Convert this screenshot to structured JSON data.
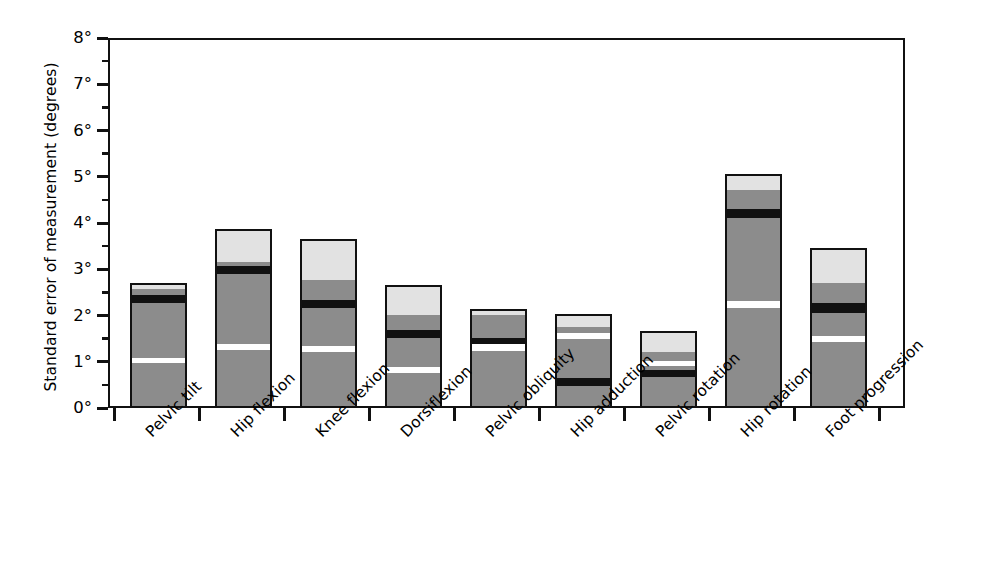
{
  "chart_data": {
    "type": "bar",
    "title": "",
    "subtitle": "",
    "xlabel": "",
    "ylabel": "Standard error of measurement (degrees)",
    "ylim": [
      0,
      8
    ],
    "ytick_values": [
      0,
      1,
      2,
      3,
      4,
      5,
      6,
      7,
      8
    ],
    "ytick_labels": [
      "0°",
      "1°",
      "2°",
      "3°",
      "4°",
      "5°",
      "6°",
      "7°",
      "8°"
    ],
    "ytick_minor_step": 0.5,
    "grid": false,
    "legend": "none",
    "stacked": true,
    "categories": [
      "Pelvic tilt",
      "Hip flexion",
      "Knee flexion",
      "Dorsiflexion",
      "Pelvic obliquity",
      "Hip adduction",
      "Pelvic rotation",
      "Hip rotation",
      "Foot progression"
    ],
    "totals": [
      2.65,
      3.83,
      3.62,
      2.62,
      2.1,
      2.0,
      1.63,
      5.02,
      3.42
    ],
    "segment_colors": {
      "gray": "#8c8c8c",
      "black": "#111111",
      "white": "#ffffff",
      "light": "#e2e2e2"
    },
    "bars": [
      {
        "category": "Pelvic tilt",
        "total": 2.65,
        "segments": [
          {
            "fill": "gray",
            "from": 0.0,
            "to": 0.92
          },
          {
            "fill": "white",
            "from": 0.92,
            "to": 1.04
          },
          {
            "fill": "gray",
            "from": 1.04,
            "to": 2.22
          },
          {
            "fill": "black",
            "from": 2.22,
            "to": 2.41
          },
          {
            "fill": "gray",
            "from": 2.41,
            "to": 2.52
          },
          {
            "fill": "light",
            "from": 2.52,
            "to": 2.65
          }
        ]
      },
      {
        "category": "Hip flexion",
        "total": 3.83,
        "segments": [
          {
            "fill": "gray",
            "from": 0.0,
            "to": 1.22
          },
          {
            "fill": "white",
            "from": 1.22,
            "to": 1.35
          },
          {
            "fill": "gray",
            "from": 1.35,
            "to": 2.85
          },
          {
            "fill": "black",
            "from": 2.85,
            "to": 3.02
          },
          {
            "fill": "gray",
            "from": 3.02,
            "to": 3.12
          },
          {
            "fill": "light",
            "from": 3.12,
            "to": 3.83
          }
        ]
      },
      {
        "category": "Knee flexion",
        "total": 3.62,
        "segments": [
          {
            "fill": "gray",
            "from": 0.0,
            "to": 1.17
          },
          {
            "fill": "white",
            "from": 1.17,
            "to": 1.3
          },
          {
            "fill": "gray",
            "from": 1.3,
            "to": 2.12
          },
          {
            "fill": "black",
            "from": 2.12,
            "to": 2.3
          },
          {
            "fill": "gray",
            "from": 2.3,
            "to": 2.72
          },
          {
            "fill": "light",
            "from": 2.72,
            "to": 3.62
          }
        ]
      },
      {
        "category": "Dorsiflexion",
        "total": 2.62,
        "segments": [
          {
            "fill": "gray",
            "from": 0.0,
            "to": 0.72
          },
          {
            "fill": "white",
            "from": 0.72,
            "to": 0.85
          },
          {
            "fill": "gray",
            "from": 0.85,
            "to": 1.46
          },
          {
            "fill": "black",
            "from": 1.46,
            "to": 1.64
          },
          {
            "fill": "gray",
            "from": 1.64,
            "to": 1.96
          },
          {
            "fill": "light",
            "from": 1.96,
            "to": 2.62
          }
        ]
      },
      {
        "category": "Pelvic obliquity",
        "total": 2.1,
        "segments": [
          {
            "fill": "gray",
            "from": 0.0,
            "to": 1.18
          },
          {
            "fill": "white",
            "from": 1.18,
            "to": 1.33
          },
          {
            "fill": "black",
            "from": 1.33,
            "to": 1.48
          },
          {
            "fill": "gray",
            "from": 1.48,
            "to": 1.97
          },
          {
            "fill": "light",
            "from": 1.97,
            "to": 2.1
          }
        ]
      },
      {
        "category": "Hip adduction",
        "total": 2.0,
        "segments": [
          {
            "fill": "gray",
            "from": 0.0,
            "to": 0.44
          },
          {
            "fill": "black",
            "from": 0.44,
            "to": 0.6
          },
          {
            "fill": "gray",
            "from": 0.6,
            "to": 1.44
          },
          {
            "fill": "white",
            "from": 1.44,
            "to": 1.57
          },
          {
            "fill": "gray",
            "from": 1.57,
            "to": 1.7
          },
          {
            "fill": "light",
            "from": 1.7,
            "to": 2.0
          }
        ]
      },
      {
        "category": "Pelvic rotation",
        "total": 1.63,
        "segments": [
          {
            "fill": "gray",
            "from": 0.0,
            "to": 0.62
          },
          {
            "fill": "black",
            "from": 0.62,
            "to": 0.78
          },
          {
            "fill": "gray",
            "from": 0.78,
            "to": 0.86
          },
          {
            "fill": "white",
            "from": 0.86,
            "to": 0.98
          },
          {
            "fill": "gray",
            "from": 0.98,
            "to": 1.16
          },
          {
            "fill": "light",
            "from": 1.16,
            "to": 1.63
          }
        ]
      },
      {
        "category": "Hip rotation",
        "total": 5.02,
        "segments": [
          {
            "fill": "gray",
            "from": 0.0,
            "to": 2.12
          },
          {
            "fill": "white",
            "from": 2.12,
            "to": 2.26
          },
          {
            "fill": "gray",
            "from": 2.26,
            "to": 4.06
          },
          {
            "fill": "black",
            "from": 4.06,
            "to": 4.26
          },
          {
            "fill": "gray",
            "from": 4.26,
            "to": 4.68
          },
          {
            "fill": "light",
            "from": 4.68,
            "to": 5.02
          }
        ]
      },
      {
        "category": "Foot progression",
        "total": 3.42,
        "segments": [
          {
            "fill": "gray",
            "from": 0.0,
            "to": 1.38
          },
          {
            "fill": "white",
            "from": 1.38,
            "to": 1.52
          },
          {
            "fill": "gray",
            "from": 1.52,
            "to": 2.02
          },
          {
            "fill": "black",
            "from": 2.02,
            "to": 2.22
          },
          {
            "fill": "gray",
            "from": 2.22,
            "to": 2.65
          },
          {
            "fill": "light",
            "from": 2.65,
            "to": 3.42
          }
        ]
      }
    ]
  }
}
